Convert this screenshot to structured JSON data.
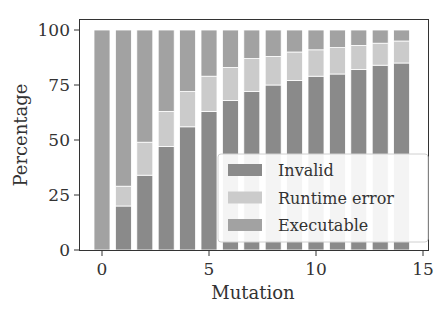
{
  "chart_data": {
    "type": "bar",
    "stacked": true,
    "title": "",
    "xlabel": "Mutation",
    "ylabel": "Percentage",
    "x": [
      0,
      1,
      2,
      3,
      4,
      5,
      6,
      7,
      8,
      9,
      10,
      11,
      12,
      13,
      14
    ],
    "xlim": [
      -0.5,
      15
    ],
    "ylim": [
      0,
      100
    ],
    "xticks": [
      0,
      5,
      10,
      15
    ],
    "yticks": [
      0,
      25,
      50,
      75,
      100
    ],
    "grid": false,
    "legend_position": "lower right",
    "series": [
      {
        "name": "Invalid",
        "color": "#8a8a8a",
        "values": [
          0,
          20,
          34,
          47,
          56,
          63,
          68,
          72,
          75,
          77,
          79,
          80,
          82,
          84,
          85
        ]
      },
      {
        "name": "Runtime error",
        "color": "#cbcbcb",
        "values": [
          0,
          9,
          15,
          16,
          16,
          16,
          15,
          15,
          13,
          13,
          12,
          12,
          11,
          10,
          10
        ]
      },
      {
        "name": "Executable",
        "color": "#a2a2a2",
        "values": [
          100,
          71,
          51,
          37,
          28,
          21,
          17,
          13,
          12,
          10,
          9,
          8,
          7,
          6,
          5
        ]
      }
    ]
  }
}
